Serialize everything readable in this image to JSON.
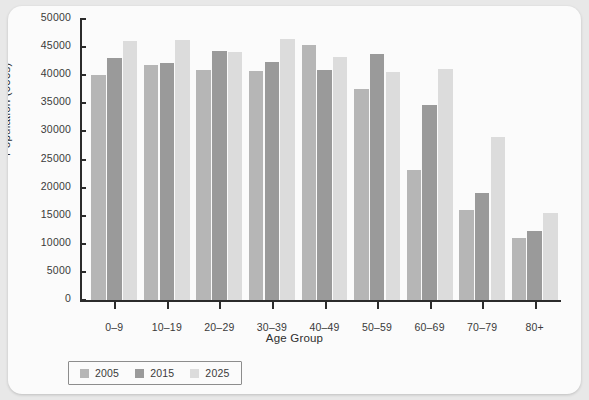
{
  "chart_data": {
    "type": "bar",
    "title": "",
    "xlabel": "Age Group",
    "ylabel": "Population (000s)",
    "categories": [
      "0–9",
      "10–19",
      "20–29",
      "30–39",
      "40–49",
      "50–59",
      "60–69",
      "70–79",
      "80+"
    ],
    "series": [
      {
        "name": "2005",
        "color": "#b6b6b6",
        "values": [
          40100,
          41900,
          41000,
          40700,
          45300,
          37500,
          23200,
          16100,
          11000
        ]
      },
      {
        "name": "2015",
        "color": "#9a9a9a",
        "values": [
          43100,
          42200,
          44300,
          42300,
          41000,
          43800,
          34700,
          19000,
          12300
        ]
      },
      {
        "name": "2025",
        "color": "#dcdcdc",
        "values": [
          46100,
          46200,
          44200,
          46500,
          43200,
          40500,
          41100,
          29000,
          15500
        ]
      }
    ],
    "ylim": [
      0,
      50000
    ],
    "yticks": [
      0,
      5000,
      10000,
      15000,
      20000,
      25000,
      30000,
      35000,
      40000,
      45000,
      50000
    ],
    "ytick_labels": [
      "0",
      "5000",
      "10000",
      "15000",
      "20000",
      "25000",
      "30000",
      "35000",
      "40000",
      "45000",
      "50000"
    ],
    "grid": false,
    "legend_position": "bottom-left",
    "legend_entries": [
      "2005",
      "2015",
      "2025"
    ]
  },
  "figure": {
    "background_color": "#fbfbfb",
    "page_background_color": "#e8e8e8",
    "axis_color": "#2b2b2b",
    "text_color": "#3a3a3a"
  }
}
